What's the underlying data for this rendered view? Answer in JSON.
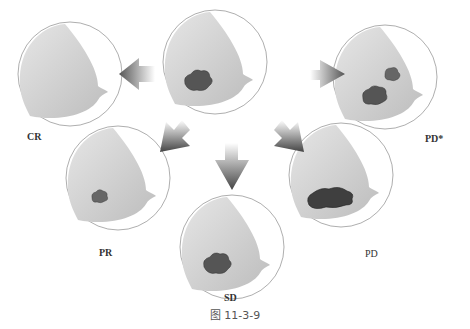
{
  "figure": {
    "caption": "图 11-3-9",
    "center": {
      "label": "",
      "tumors": 1
    },
    "panels": [
      {
        "id": "cr",
        "label": "CR"
      },
      {
        "id": "pd-star",
        "label": "PD*"
      },
      {
        "id": "pr",
        "label": "PR"
      },
      {
        "id": "sd",
        "label": "SD"
      },
      {
        "id": "pd",
        "label": "PD"
      }
    ]
  },
  "colors": {
    "breast_fill": "#d8d8d8",
    "tumor": "#555555",
    "outline": "#999999"
  }
}
